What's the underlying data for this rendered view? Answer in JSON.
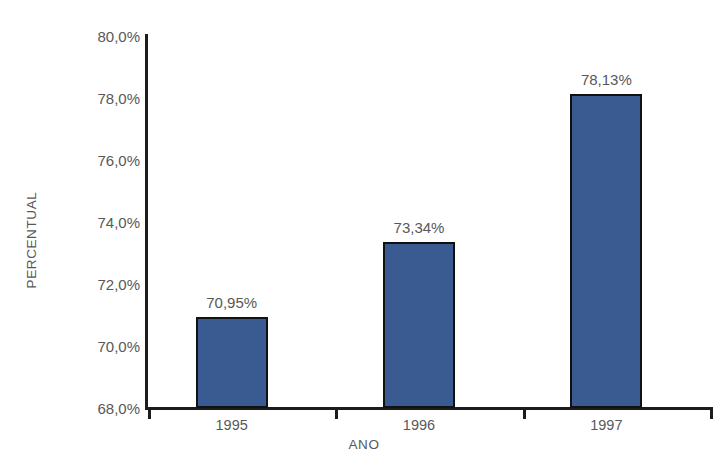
{
  "chart_data": {
    "type": "bar",
    "title": "",
    "subtitle": "",
    "xlabel": "ANO",
    "ylabel": "PERCENTUAL",
    "categories": [
      "1995",
      "1996",
      "1997"
    ],
    "values": [
      70.95,
      73.34,
      78.13
    ],
    "value_labels": [
      "70,95%",
      "73,34%",
      "78,13%"
    ],
    "ylim": [
      68.0,
      80.0
    ],
    "ytick_values": [
      68.0,
      70.0,
      72.0,
      74.0,
      76.0,
      78.0,
      80.0
    ],
    "ytick_labels": [
      "68,0%",
      "70,0%",
      "72,0%",
      "74,0%",
      "76,0%",
      "78,0%",
      "80,0%"
    ],
    "grid": false,
    "legend": false,
    "legend_position": "none",
    "series": [
      {
        "name": "PERCENTUAL",
        "values": [
          70.95,
          73.34,
          78.13
        ],
        "color": "#3a5a92"
      }
    ],
    "bar_color": "#3a5a92",
    "bar_outline_color": "#111111",
    "axis_color": "#1c1c1c",
    "text_color": "#58585a",
    "background_color": "#ffffff"
  }
}
